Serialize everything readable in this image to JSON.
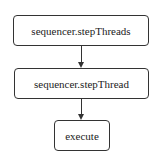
{
  "diagram": {
    "type": "flowchart",
    "nodes": [
      {
        "id": "n1",
        "label": "sequencer.stepThreads"
      },
      {
        "id": "n2",
        "label": "sequencer.stepThread"
      },
      {
        "id": "n3",
        "label": "execute"
      }
    ],
    "edges": [
      {
        "from": "n1",
        "to": "n2"
      },
      {
        "from": "n2",
        "to": "n3"
      }
    ]
  }
}
